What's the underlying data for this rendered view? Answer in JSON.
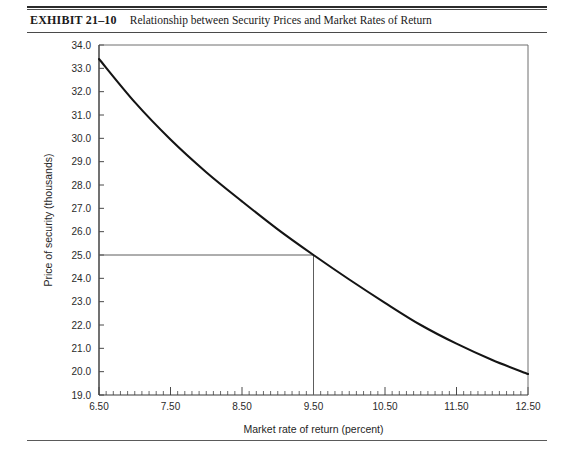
{
  "exhibit": {
    "number": "EXHIBIT 21–10",
    "caption": "Relationship between Security Prices and Market Rates of Return"
  },
  "chart_data": {
    "type": "line",
    "title": "Relationship between Security Prices and Market Rates of Return",
    "xlabel": "Market rate of return (percent)",
    "ylabel": "Price of security (thousands)",
    "xlim": [
      6.5,
      12.5
    ],
    "ylim": [
      19.0,
      34.0
    ],
    "x_tick_labels": [
      "6.50",
      "7.50",
      "8.50",
      "9.50",
      "10.50",
      "11.50",
      "12.50"
    ],
    "x_tick_values": [
      6.5,
      7.5,
      8.5,
      9.5,
      10.5,
      11.5,
      12.5
    ],
    "x_minor_step": 0.1,
    "y_tick_labels": [
      "19.0",
      "20.0",
      "21.0",
      "22.0",
      "23.0",
      "24.0",
      "25.0",
      "26.0",
      "27.0",
      "28.0",
      "29.0",
      "30.0",
      "31.0",
      "32.0",
      "33.0",
      "34.0"
    ],
    "y_tick_values": [
      19.0,
      20.0,
      21.0,
      22.0,
      23.0,
      24.0,
      25.0,
      26.0,
      27.0,
      28.0,
      29.0,
      30.0,
      31.0,
      32.0,
      33.0,
      34.0
    ],
    "grid": false,
    "legend": null,
    "series": [
      {
        "name": "Price of security",
        "x": [
          6.5,
          6.75,
          7.0,
          7.25,
          7.5,
          7.75,
          8.0,
          8.25,
          8.5,
          8.75,
          9.0,
          9.25,
          9.5,
          9.75,
          10.0,
          10.25,
          10.5,
          10.75,
          11.0,
          11.25,
          11.5,
          11.75,
          12.0,
          12.25,
          12.5
        ],
        "y": [
          33.4,
          32.65,
          31.92,
          31.24,
          30.58,
          29.96,
          29.36,
          28.79,
          28.25,
          27.73,
          27.23,
          26.75,
          25.0,
          25.85,
          25.43,
          25.03,
          24.64,
          24.27,
          23.92,
          23.57,
          23.24,
          22.92,
          22.62,
          22.32,
          19.9
        ]
      }
    ],
    "curve_points": [
      {
        "x": 6.5,
        "y": 33.4
      },
      {
        "x": 7.0,
        "y": 31.55
      },
      {
        "x": 7.5,
        "y": 29.95
      },
      {
        "x": 8.0,
        "y": 28.55
      },
      {
        "x": 8.5,
        "y": 27.3
      },
      {
        "x": 9.0,
        "y": 26.1
      },
      {
        "x": 9.5,
        "y": 25.0
      },
      {
        "x": 10.0,
        "y": 23.95
      },
      {
        "x": 10.5,
        "y": 22.95
      },
      {
        "x": 11.0,
        "y": 22.0
      },
      {
        "x": 11.5,
        "y": 21.2
      },
      {
        "x": 12.0,
        "y": 20.5
      },
      {
        "x": 12.5,
        "y": 19.9
      }
    ],
    "reference_lines": [
      {
        "orientation": "horizontal",
        "value": 25.0,
        "from": 6.5,
        "to": 9.5
      },
      {
        "orientation": "vertical",
        "value": 9.5,
        "from": 19.0,
        "to": 25.0
      }
    ],
    "annotations": []
  }
}
